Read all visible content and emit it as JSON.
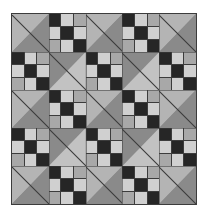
{
  "figure": {
    "background_color": "#ffffff",
    "width": 207,
    "height": 216
  },
  "quilt": {
    "grid_rows": 5,
    "grid_columns": 5,
    "border_color": "#3c3c3c",
    "seam_color": "#3a3a3a",
    "panel": {
      "left": 11,
      "top": 13,
      "width": 186,
      "height": 192
    },
    "palette": {
      "dark": "#262626",
      "light": "#d0d0d0",
      "medium": "#a8a8a8",
      "triangle_light": "#b4b4b4",
      "triangle_pale": "#c2c2c2",
      "triangle_gray": "#8a8a8a"
    },
    "unit_types": {
      "hst": "half-square-triangle",
      "ninepatch": "nine-patch"
    },
    "layout": [
      [
        "hst",
        "ninepatch",
        "hst",
        "ninepatch",
        "hst"
      ],
      [
        "ninepatch",
        "hst",
        "ninepatch",
        "hst",
        "ninepatch"
      ],
      [
        "hst",
        "ninepatch",
        "hst",
        "ninepatch",
        "hst"
      ],
      [
        "ninepatch",
        "hst",
        "ninepatch",
        "hst",
        "ninepatch"
      ],
      [
        "hst",
        "ninepatch",
        "hst",
        "ninepatch",
        "hst"
      ]
    ],
    "ninepatch_cells": [
      [
        "dark",
        "light",
        "medium"
      ],
      [
        "light",
        "dark",
        "light"
      ],
      [
        "medium",
        "light",
        "dark"
      ]
    ],
    "triangle_orientations": [
      [
        "orient-tl",
        "",
        "orient-tl",
        "",
        "orient-tl"
      ],
      [
        "",
        "orient-br",
        "",
        "orient-br",
        ""
      ],
      [
        "orient-tl",
        "",
        "orient-tl",
        "",
        "orient-tl"
      ],
      [
        "",
        "orient-br",
        "",
        "orient-br",
        ""
      ],
      [
        "orient-tl",
        "",
        "orient-tl",
        "",
        "orient-tl"
      ]
    ]
  }
}
